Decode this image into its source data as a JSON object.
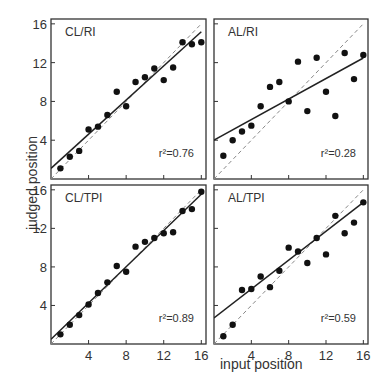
{
  "figure": {
    "ylabel": "judged  position",
    "xlabel": "input  position"
  },
  "chart_data": [
    {
      "type": "scatter",
      "title": "CL/RI",
      "annotation": "r² = 0.76",
      "xlabel": "input position",
      "ylabel": "judged position",
      "xlim": [
        0,
        16.5
      ],
      "ylim": [
        0,
        16.5
      ],
      "xticks": [
        4,
        8,
        12,
        16
      ],
      "yticks": [
        4,
        8,
        12,
        16
      ],
      "x": [
        1,
        2,
        3,
        4,
        5,
        6,
        7,
        8,
        9,
        10,
        11,
        12,
        13,
        14,
        15,
        16
      ],
      "y": [
        1.1,
        2.3,
        2.9,
        5.1,
        5.4,
        6.6,
        9.0,
        7.5,
        10.0,
        10.5,
        11.4,
        10.2,
        11.5,
        14.1,
        13.9,
        14.1
      ],
      "fit_line": {
        "intercept": 1.1,
        "slope": 0.88
      },
      "identity_line": true
    },
    {
      "type": "scatter",
      "title": "AL/RI",
      "annotation": "r² = 0.28",
      "xlabel": "input position",
      "ylabel": "judged position",
      "xlim": [
        0,
        16.5
      ],
      "ylim": [
        0,
        16.5
      ],
      "xticks": [
        4,
        8,
        12,
        16
      ],
      "yticks": [
        4,
        8,
        12,
        16
      ],
      "x": [
        1,
        2,
        3,
        4,
        5,
        6,
        7,
        8,
        9,
        10,
        11,
        12,
        13,
        14,
        15,
        16
      ],
      "y": [
        2.4,
        4.0,
        4.9,
        5.5,
        7.5,
        9.5,
        10.0,
        8.0,
        12.1,
        7.0,
        12.5,
        9.0,
        6.5,
        13.0,
        10.3,
        12.8
      ],
      "fit_line": {
        "intercept": 4.0,
        "slope": 0.53
      },
      "identity_line": true
    },
    {
      "type": "scatter",
      "title": "CL/TPI",
      "annotation": "r² = 0.89",
      "xlabel": "input position",
      "ylabel": "judged position",
      "xlim": [
        0,
        16.5
      ],
      "ylim": [
        0,
        16.5
      ],
      "xticks": [
        4,
        8,
        12,
        16
      ],
      "yticks": [
        4,
        8,
        12,
        16
      ],
      "x": [
        1,
        2,
        3,
        4,
        5,
        6,
        7,
        8,
        9,
        10,
        11,
        12,
        13,
        14,
        15,
        16
      ],
      "y": [
        1.0,
        2.0,
        3.0,
        4.1,
        5.3,
        6.4,
        8.1,
        7.5,
        10.1,
        10.6,
        11.0,
        11.5,
        11.6,
        13.8,
        14.0,
        15.8
      ],
      "fit_line": {
        "intercept": 0.5,
        "slope": 0.94
      },
      "identity_line": true
    },
    {
      "type": "scatter",
      "title": "AL/TPI",
      "annotation": "r² = 0.59",
      "xlabel": "input position",
      "ylabel": "judged position",
      "xlim": [
        0,
        16.5
      ],
      "ylim": [
        0,
        16.5
      ],
      "xticks": [
        4,
        8,
        12,
        16
      ],
      "yticks": [
        4,
        8,
        12,
        16
      ],
      "x": [
        1,
        2,
        3,
        4,
        5,
        6,
        7,
        8,
        9,
        10,
        11,
        12,
        13,
        14,
        15,
        16
      ],
      "y": [
        0.8,
        2.0,
        5.6,
        5.7,
        7.0,
        5.9,
        7.6,
        10.0,
        9.6,
        8.4,
        11.0,
        9.3,
        13.3,
        11.5,
        12.6,
        14.7
      ],
      "fit_line": {
        "intercept": 2.7,
        "slope": 0.75
      },
      "identity_line": true
    }
  ]
}
